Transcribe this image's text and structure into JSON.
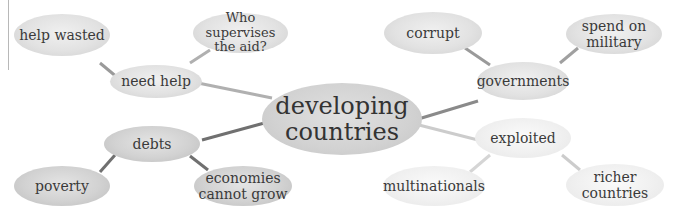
{
  "diagram": {
    "title": "developing countries",
    "center": {
      "line1": "developing",
      "line2": "countries"
    },
    "branches": [
      {
        "label": "need help",
        "children": [
          {
            "label": "help wasted"
          },
          {
            "line1": "Who supervises",
            "line2": "the aid?"
          }
        ]
      },
      {
        "label": "governments",
        "children": [
          {
            "label": "corrupt"
          },
          {
            "line1": "spend on",
            "line2": "military"
          }
        ]
      },
      {
        "label": "debts",
        "children": [
          {
            "label": "poverty"
          },
          {
            "line1": "economies",
            "line2": "cannot grow"
          }
        ]
      },
      {
        "label": "exploited",
        "children": [
          {
            "label": "multinationals"
          },
          {
            "line1": "richer",
            "line2": "countries"
          }
        ]
      }
    ],
    "colors": {
      "line_light": "#b5b5b5",
      "line_mid": "#8a8a8a",
      "line_dark": "#707070",
      "line_faint": "#d8d8d8",
      "text": "#3a3a3a"
    }
  }
}
